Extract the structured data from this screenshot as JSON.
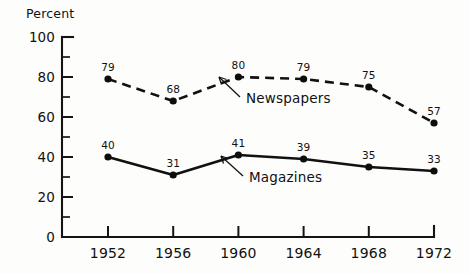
{
  "chart_data": {
    "type": "line",
    "title": "",
    "xlabel": "",
    "ylabel": "Percent",
    "categories": [
      "1952",
      "1956",
      "1960",
      "1964",
      "1968",
      "1972"
    ],
    "x": [
      1952,
      1956,
      1960,
      1964,
      1968,
      1972
    ],
    "ylim": [
      0,
      100
    ],
    "xlim": [
      1950,
      1973
    ],
    "grid": false,
    "legend_position": "inline-annotation",
    "y_major_ticks": [
      0,
      20,
      40,
      60,
      80,
      100
    ],
    "y_minor_ticks": [
      10,
      30,
      50,
      70,
      90
    ],
    "y_tick_labels": [
      "0",
      "20",
      "40",
      "60",
      "80",
      "100"
    ],
    "series": [
      {
        "name": "Newspapers",
        "style": "dashed",
        "marker": "filled-circle",
        "values": [
          79,
          68,
          80,
          79,
          75,
          57
        ],
        "value_labels": [
          "79",
          "68",
          "80",
          "79",
          "75",
          "57"
        ]
      },
      {
        "name": "Magazines",
        "style": "solid",
        "marker": "filled-circle",
        "values": [
          40,
          31,
          41,
          39,
          35,
          33
        ],
        "value_labels": [
          "40",
          "31",
          "41",
          "39",
          "35",
          "33"
        ]
      }
    ],
    "annotations": [
      {
        "text": "Newspapers",
        "points_to_series": "Newspapers"
      },
      {
        "text": "Magazines",
        "points_to_series": "Magazines"
      }
    ],
    "colors": {
      "line": "#111111",
      "marker": "#0d0d0d",
      "axis": "#141414",
      "background": "#fdfdfc"
    }
  }
}
